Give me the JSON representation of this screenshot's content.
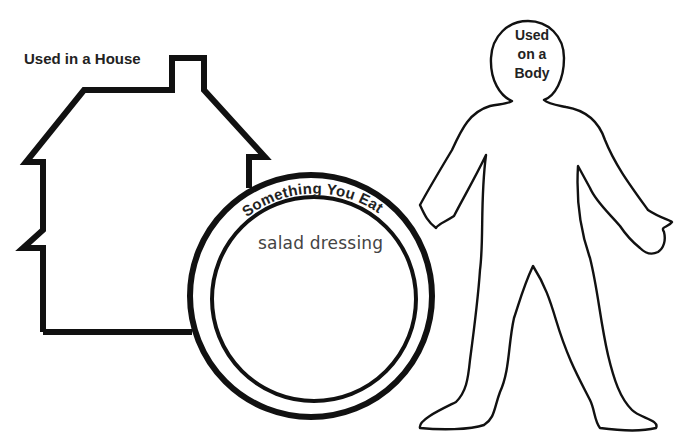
{
  "worksheet": {
    "house": {
      "label": "Used in a House",
      "shape": "house-outline"
    },
    "plate": {
      "label": "Something You Eat",
      "entries": [
        "salad dressing"
      ],
      "shape": "plate-outline"
    },
    "body": {
      "label_lines": [
        "Used",
        "on a",
        "Body"
      ],
      "shape": "person-outline"
    }
  },
  "colors": {
    "stroke": "#111111",
    "label_text": "#222222",
    "entry_text": "#444444",
    "background": "#ffffff"
  }
}
